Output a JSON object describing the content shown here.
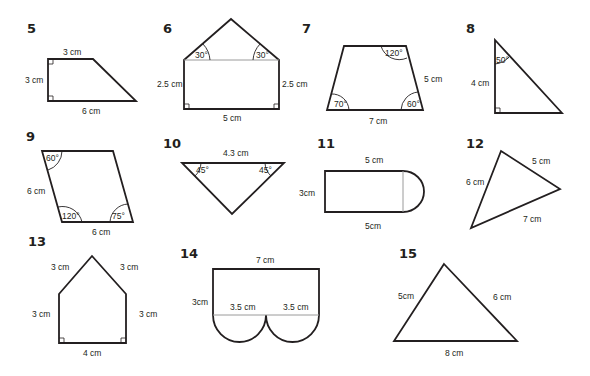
{
  "worksheet": {
    "problems": [
      {
        "number": "5",
        "shape": "right trapezoid",
        "labels": {
          "top": "3 cm",
          "left": "3 cm",
          "bottom": "6 cm"
        }
      },
      {
        "number": "6",
        "shape": "house pentagon",
        "labels": {
          "left": "2.5 cm",
          "right": "2.5 cm",
          "bottom": "5 cm",
          "angle_left": "30°",
          "angle_right": "30°"
        }
      },
      {
        "number": "7",
        "shape": "trapezoid",
        "labels": {
          "right": "5 cm",
          "bottom": "7 cm",
          "angle_top_right": "120°",
          "angle_bottom_left": "70°",
          "angle_bottom_right": "60°"
        }
      },
      {
        "number": "8",
        "shape": "right triangle",
        "labels": {
          "left": "4 cm",
          "angle_top": "50°"
        }
      },
      {
        "number": "9",
        "shape": "parallelogram",
        "labels": {
          "left": "6 cm",
          "bottom": "6 cm",
          "angle_top_left": "60°",
          "angle_bottom_left": "120°",
          "angle_bottom_right": "75°"
        }
      },
      {
        "number": "10",
        "shape": "inverted triangle",
        "labels": {
          "top": "4.3 cm",
          "angle_left": "45°",
          "angle_right": "45°"
        }
      },
      {
        "number": "11",
        "shape": "rectangle with semicircle",
        "labels": {
          "top": "5 cm",
          "left": "3cm",
          "bottom": "5cm"
        }
      },
      {
        "number": "12",
        "shape": "scalene triangle",
        "labels": {
          "left": "6 cm",
          "top_right": "5 cm",
          "bottom": "7 cm"
        }
      },
      {
        "number": "13",
        "shape": "pentagon",
        "labels": {
          "roof_left": "3 cm",
          "roof_right": "3 cm",
          "left": "3 cm",
          "right": "3 cm",
          "bottom": "4 cm"
        }
      },
      {
        "number": "14",
        "shape": "rectangle with two semicircles",
        "labels": {
          "top": "7 cm",
          "left": "3cm",
          "diam_left": "3.5 cm",
          "diam_right": "3.5 cm"
        }
      },
      {
        "number": "15",
        "shape": "scalene triangle",
        "labels": {
          "left": "5cm",
          "right": "6 cm",
          "bottom": "8 cm"
        }
      }
    ]
  }
}
